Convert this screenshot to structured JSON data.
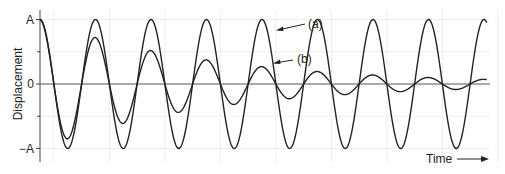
{
  "chart_data": {
    "type": "line",
    "title": "",
    "xlabel": "Time",
    "ylabel": "Displacement",
    "yticks": [
      {
        "value": 1,
        "label": "A"
      },
      {
        "value": 0,
        "label": "0"
      },
      {
        "value": -1,
        "label": "−A"
      }
    ],
    "ylim": [
      -1,
      1
    ],
    "xlim": [
      0,
      8.05
    ],
    "grid": true,
    "period": 1,
    "series": [
      {
        "name": "(a)",
        "label": "(a)",
        "description": "undamped oscillation",
        "amplitude": 1,
        "decay_per_period": 1.0
      },
      {
        "name": "(b)",
        "label": "(b)",
        "description": "damped oscillation",
        "amplitude": 1,
        "decay_per_period": 0.72
      }
    ],
    "annotations": [
      {
        "text": "(a)",
        "target_series": "(a)"
      },
      {
        "text": "(b)",
        "target_series": "(b)"
      }
    ]
  }
}
